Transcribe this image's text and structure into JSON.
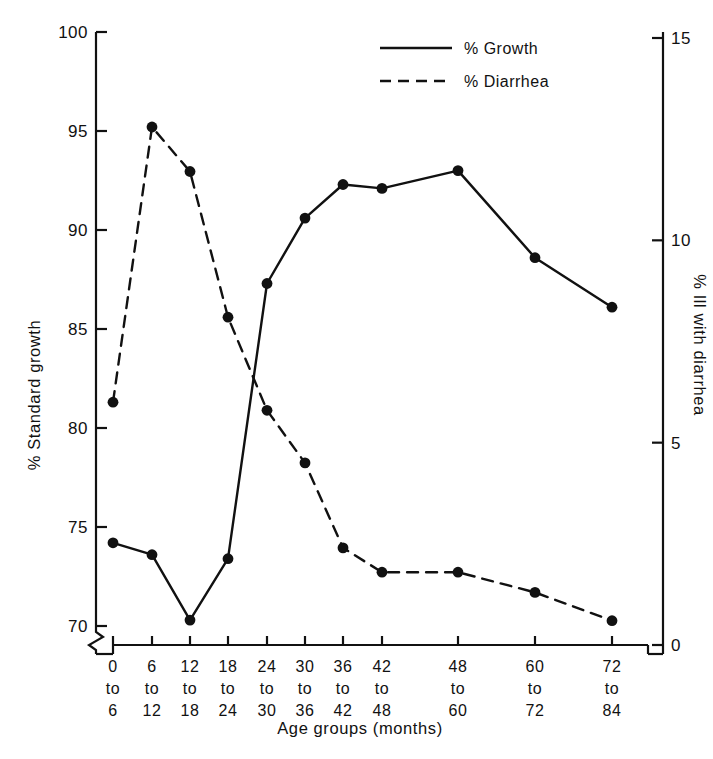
{
  "chart_data": {
    "type": "line",
    "title": "",
    "xlabel": "Age groups (months)",
    "ylabel": "% Standard growth",
    "y2label": "% Ill with diarrhea",
    "categories": [
      "0 to 6",
      "6 to 12",
      "12 to 18",
      "18 to 24",
      "24 to 30",
      "30 to 36",
      "36 to 42",
      "42 to 48",
      "48 to 60",
      "60 to 72",
      "72 to 84"
    ],
    "category_lines": [
      [
        "0",
        "to",
        "6"
      ],
      [
        "6",
        "to",
        "12"
      ],
      [
        "12",
        "to",
        "18"
      ],
      [
        "18",
        "to",
        "24"
      ],
      [
        "24",
        "to",
        "30"
      ],
      [
        "30",
        "to",
        "36"
      ],
      [
        "36",
        "to",
        "42"
      ],
      [
        "42",
        "to",
        "48"
      ],
      [
        "48",
        "to",
        "60"
      ],
      [
        "60",
        "to",
        "72"
      ],
      [
        "72",
        "to",
        "84"
      ]
    ],
    "ylim": [
      70,
      100
    ],
    "yticks": [
      "70",
      "75",
      "80",
      "85",
      "90",
      "95",
      "100"
    ],
    "ytick_values": [
      70,
      75,
      80,
      85,
      90,
      95,
      100
    ],
    "y2lim": [
      0,
      15
    ],
    "y2ticks": [
      "0",
      "5",
      "10",
      "15"
    ],
    "y2tick_values": [
      0,
      5,
      10,
      15
    ],
    "y_axis_break": true,
    "grid": false,
    "legend_position": "top-center",
    "series": [
      {
        "name": "% Growth",
        "axis": "left",
        "style": "solid",
        "marker": "filled-circle",
        "color": "#111111",
        "values": [
          74.2,
          73.6,
          70.3,
          73.4,
          87.3,
          90.6,
          92.3,
          92.1,
          93.0,
          88.6,
          86.1
        ]
      },
      {
        "name": "% Diarrhea",
        "axis": "right",
        "style": "dashed",
        "marker": "filled-circle",
        "color": "#111111",
        "values": [
          6.0,
          12.8,
          11.7,
          8.1,
          5.8,
          4.5,
          2.4,
          1.8,
          1.8,
          1.3,
          0.6
        ]
      }
    ],
    "legend": [
      "% Growth",
      "% Diarrhea"
    ]
  },
  "legend": {
    "growth_label": "% Growth",
    "diarrhea_label": "% Diarrhea"
  },
  "axes": {
    "left_title": "% Standard growth",
    "right_title": "% Ill with diarrhea",
    "bottom_title": "Age groups (months)"
  }
}
